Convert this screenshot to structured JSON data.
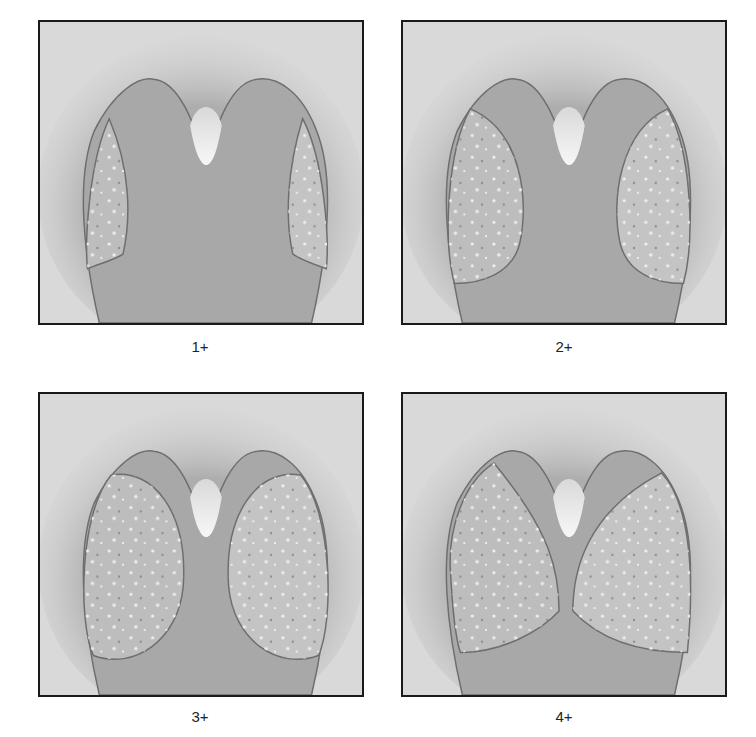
{
  "figure": {
    "panels": [
      {
        "id": "grade-1",
        "label": "1+",
        "severity": 1
      },
      {
        "id": "grade-2",
        "label": "2+",
        "severity": 2
      },
      {
        "id": "grade-3",
        "label": "3+",
        "severity": 3
      },
      {
        "id": "grade-4",
        "label": "4+",
        "severity": 4
      }
    ],
    "colors": {
      "background": "#d9d9d9",
      "structure_fill": "#a8a8a8",
      "structure_top": "#9a9a9a",
      "lobe_fill": "#bdbdbd",
      "outline": "#6e6e6e",
      "notch_highlight": "#f4f4f4",
      "border": "#1a1a1a"
    }
  }
}
